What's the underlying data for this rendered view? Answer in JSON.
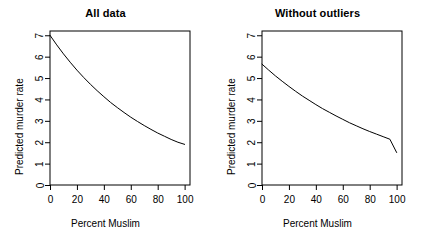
{
  "figure": {
    "background": "#ffffff",
    "line_color": "#000000",
    "axis_color": "#000000",
    "width": 423,
    "height": 250
  },
  "panels": [
    {
      "id": "all-data",
      "title": "All data",
      "xlabel": "Percent Muslim",
      "ylabel": "Predicted murder rate"
    },
    {
      "id": "without-outliers",
      "title": "Without outliers",
      "xlabel": "Percent Muslim",
      "ylabel": "Predicted murder rate"
    }
  ],
  "chart_data": [
    {
      "type": "line",
      "title": "All data",
      "xlabel": "Percent Muslim",
      "ylabel": "Predicted murder rate",
      "xlim": [
        0,
        104
      ],
      "ylim": [
        0,
        7.2
      ],
      "xticks": [
        0,
        20,
        40,
        60,
        80,
        100
      ],
      "yticks": [
        0,
        1,
        2,
        3,
        4,
        5,
        6,
        7
      ],
      "grid": false,
      "legend": null,
      "series": [
        {
          "name": "Predicted murder rate (all data)",
          "x": [
            0,
            5,
            10,
            15,
            20,
            25,
            30,
            35,
            40,
            45,
            50,
            55,
            60,
            65,
            70,
            75,
            80,
            85,
            90,
            95,
            100
          ],
          "values": [
            7.0,
            6.55,
            6.13,
            5.74,
            5.37,
            5.03,
            4.71,
            4.41,
            4.13,
            3.86,
            3.62,
            3.39,
            3.17,
            2.97,
            2.78,
            2.6,
            2.43,
            2.28,
            2.13,
            2.0,
            1.9
          ]
        }
      ]
    },
    {
      "type": "line",
      "title": "Without outliers",
      "xlabel": "Percent Muslim",
      "ylabel": "Predicted murder rate",
      "xlim": [
        0,
        104
      ],
      "ylim": [
        0,
        7.2
      ],
      "xticks": [
        0,
        20,
        40,
        60,
        80,
        100
      ],
      "yticks": [
        0,
        1,
        2,
        3,
        4,
        5,
        6,
        7
      ],
      "grid": false,
      "legend": null,
      "series": [
        {
          "name": "Predicted murder rate (without outliers)",
          "x": [
            0,
            5,
            10,
            15,
            20,
            25,
            30,
            35,
            40,
            45,
            50,
            55,
            60,
            65,
            70,
            75,
            80,
            85,
            90,
            95,
            100
          ],
          "values": [
            5.65,
            5.37,
            5.1,
            4.85,
            4.61,
            4.38,
            4.16,
            3.96,
            3.76,
            3.57,
            3.4,
            3.23,
            3.07,
            2.91,
            2.77,
            2.63,
            2.5,
            2.38,
            2.26,
            2.14,
            1.52
          ]
        }
      ]
    }
  ]
}
